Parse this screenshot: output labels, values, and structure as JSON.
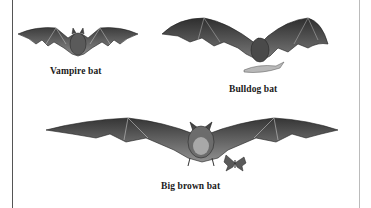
{
  "figure": {
    "bats": [
      {
        "name": "vampire",
        "label": "Vampire bat"
      },
      {
        "name": "bulldog",
        "label": "Bulldog bat"
      },
      {
        "name": "big-brown",
        "label": "Big brown bat"
      }
    ]
  },
  "colors": {
    "wing": "#4a4a4a",
    "wing_light": "#8a8a8a",
    "body": "#3a3a3a",
    "border_left": "#555555",
    "border_right": "#bbbbbb"
  }
}
